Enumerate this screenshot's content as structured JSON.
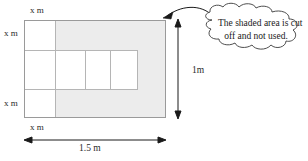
{
  "figure": {
    "type": "geometry-diagram",
    "shaded_color": "#ececec",
    "outline_color": "#9a9a9a",
    "inner_line_color": "#b5b5b5",
    "arrow_color": "#1a1a1a",
    "background": "#ffffff"
  },
  "labels": {
    "top_x": "x m",
    "top_x_var": "x",
    "top_x_unit": "m",
    "left_upper_x": "x m",
    "left_lower_x": "x m",
    "bottom_x": "x m",
    "width_dim": "1.5 m",
    "height_dim": "1m"
  },
  "callout": {
    "line1": "The shaded area is cut",
    "line2": "off and not used.",
    "full_text": "The shaded area is cut off and not used."
  },
  "dimensions": {
    "overall_width": "1.5 m",
    "overall_height": "1 m",
    "corner_margin": "x m"
  },
  "geometry": {
    "outer_rect": {
      "x": 24,
      "y": 20,
      "w": 142,
      "h": 98
    },
    "left_column_x": 55,
    "band_top_y": 50,
    "band_bottom_y": 90,
    "band_right_x": 138,
    "inner_dividers": [
      85,
      110
    ],
    "arrow_v_x": 178,
    "arrow_h_y": 140
  }
}
